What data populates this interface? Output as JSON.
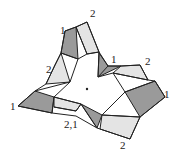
{
  "diagram": {
    "type": "polyhedral-surface-tiling",
    "colors": {
      "dark": "#9a9a9a",
      "light": "#e4e4e4",
      "stroke": "#222222",
      "background": "#ffffff"
    },
    "labels": [
      {
        "id": "top-2",
        "text": "2",
        "x": 90,
        "y": 17
      },
      {
        "id": "upper-left-1",
        "text": "1",
        "x": 60,
        "y": 34
      },
      {
        "id": "left-2",
        "text": "2",
        "x": 46,
        "y": 73
      },
      {
        "id": "inner-right-1",
        "text": "1",
        "x": 111,
        "y": 63
      },
      {
        "id": "right-2",
        "text": "2",
        "x": 145,
        "y": 65
      },
      {
        "id": "far-right-1",
        "text": "1",
        "x": 164,
        "y": 98
      },
      {
        "id": "far-left-1",
        "text": "1",
        "x": 10,
        "y": 110
      },
      {
        "id": "bottom-2-1",
        "text": "2,1",
        "x": 64,
        "y": 128
      },
      {
        "id": "bottom-2",
        "text": "2",
        "x": 120,
        "y": 149
      }
    ],
    "center_point": {
      "x": 87,
      "y": 89
    }
  }
}
